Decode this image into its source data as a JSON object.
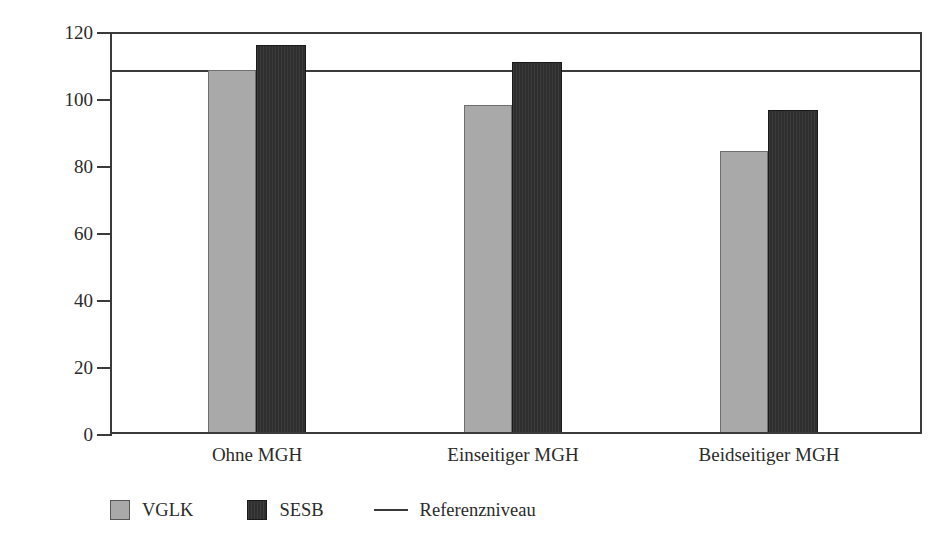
{
  "chart_data": {
    "type": "bar",
    "title": "",
    "xlabel": "",
    "ylabel": "Deutschsprachige Leseleistung",
    "categories": [
      "Ohne MGH",
      "Einseitiger MGH",
      "Beidseitiger MGH"
    ],
    "series": [
      {
        "name": "VGLK",
        "color": "#a9a9a9",
        "values": [
          108,
          97.5,
          84
        ]
      },
      {
        "name": "SESB",
        "color": "#2f2f2f",
        "values": [
          115.5,
          110.5,
          96
        ]
      }
    ],
    "reference_line": {
      "label": "Referenzniveau",
      "value": 108,
      "color": "#3a3a3a"
    },
    "ylim": [
      0,
      120
    ],
    "yticks": [
      0,
      20,
      40,
      60,
      80,
      100,
      120
    ],
    "ytick_labels": [
      "0",
      "20",
      "40",
      "60",
      "80",
      "100",
      "120"
    ],
    "grid": false,
    "legend_position": "bottom-left"
  },
  "axes": {
    "y_title": "Deutschsprachige Leseleistung",
    "y_tick_labels": [
      "120",
      "100",
      "80",
      "60",
      "40",
      "20",
      "0"
    ],
    "x_tick_labels": [
      "Ohne MGH",
      "Einseitiger MGH",
      "Beidseitiger MGH"
    ]
  },
  "legend": {
    "items": [
      {
        "label": "VGLK",
        "marker": "square-light-gray"
      },
      {
        "label": "SESB",
        "marker": "square-dark"
      },
      {
        "label": "Referenzniveau",
        "marker": "line"
      }
    ]
  }
}
